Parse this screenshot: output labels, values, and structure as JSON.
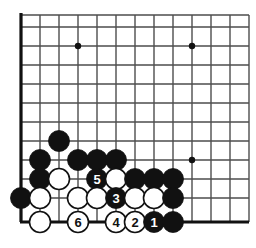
{
  "figure": {
    "kind": "go-board-diagram",
    "title": "",
    "width": 256,
    "height": 248,
    "background_color": "#ffffff",
    "line_color": "#4d4d4d",
    "edge_line_color": "#111111",
    "black_stone_color": "#111111",
    "white_stone_color": "#ffffff",
    "white_stone_border_color": "#111111",
    "black_label_color": "#ffffff",
    "white_label_color": "#111111"
  },
  "grid": {
    "x_lines": [
      21,
      40,
      59,
      78,
      97,
      116,
      135,
      154,
      173,
      192,
      211,
      230,
      249
    ],
    "y_lines": [
      15,
      27,
      46,
      65,
      84,
      103,
      122,
      141,
      160,
      179,
      198,
      222
    ],
    "left_edge_x": 21,
    "bottom_edge_y": 222,
    "spacing": 19,
    "stone_radius": 10.5
  },
  "star_points": [
    {
      "name": "star-point-upper-left",
      "cx": 78,
      "cy": 46,
      "r": 3.2
    },
    {
      "name": "star-point-upper-right",
      "cx": 192,
      "cy": 46,
      "r": 3.2
    },
    {
      "name": "star-point-lower-right",
      "cx": 192,
      "cy": 160,
      "r": 3.2
    }
  ],
  "stones": [
    {
      "name": "black-stone-a",
      "color": "black",
      "cx": 59,
      "cy": 141,
      "label": ""
    },
    {
      "name": "black-stone-b",
      "color": "black",
      "cx": 40,
      "cy": 160,
      "label": ""
    },
    {
      "name": "black-stone-c",
      "color": "black",
      "cx": 78,
      "cy": 160,
      "label": ""
    },
    {
      "name": "black-stone-d",
      "color": "black",
      "cx": 97,
      "cy": 160,
      "label": ""
    },
    {
      "name": "black-stone-e",
      "color": "black",
      "cx": 116,
      "cy": 160,
      "label": ""
    },
    {
      "name": "black-stone-f",
      "color": "black",
      "cx": 40,
      "cy": 179,
      "label": ""
    },
    {
      "name": "white-stone-g",
      "color": "white",
      "cx": 59,
      "cy": 179,
      "label": ""
    },
    {
      "name": "black-stone-move-5",
      "color": "black",
      "cx": 97,
      "cy": 179,
      "label": "5"
    },
    {
      "name": "white-stone-h",
      "color": "white",
      "cx": 116,
      "cy": 179,
      "label": ""
    },
    {
      "name": "black-stone-i",
      "color": "black",
      "cx": 135,
      "cy": 179,
      "label": ""
    },
    {
      "name": "black-stone-j",
      "color": "black",
      "cx": 154,
      "cy": 179,
      "label": ""
    },
    {
      "name": "black-stone-k",
      "color": "black",
      "cx": 173,
      "cy": 179,
      "label": ""
    },
    {
      "name": "black-stone-l",
      "color": "black",
      "cx": 21,
      "cy": 198,
      "label": ""
    },
    {
      "name": "white-stone-m",
      "color": "white",
      "cx": 40,
      "cy": 198,
      "label": ""
    },
    {
      "name": "white-stone-n",
      "color": "white",
      "cx": 78,
      "cy": 198,
      "label": ""
    },
    {
      "name": "white-stone-o",
      "color": "white",
      "cx": 97,
      "cy": 198,
      "label": ""
    },
    {
      "name": "black-stone-move-3",
      "color": "black",
      "cx": 116,
      "cy": 198,
      "label": "3"
    },
    {
      "name": "white-stone-p",
      "color": "white",
      "cx": 135,
      "cy": 198,
      "label": ""
    },
    {
      "name": "white-stone-q",
      "color": "white",
      "cx": 154,
      "cy": 198,
      "label": ""
    },
    {
      "name": "black-stone-r",
      "color": "black",
      "cx": 173,
      "cy": 198,
      "label": ""
    },
    {
      "name": "white-stone-s",
      "color": "white",
      "cx": 40,
      "cy": 222,
      "label": ""
    },
    {
      "name": "white-stone-move-6",
      "color": "white",
      "cx": 78,
      "cy": 222,
      "label": "6"
    },
    {
      "name": "white-stone-move-4",
      "color": "white",
      "cx": 116,
      "cy": 222,
      "label": "4"
    },
    {
      "name": "white-stone-move-2",
      "color": "white",
      "cx": 135,
      "cy": 222,
      "label": "2"
    },
    {
      "name": "black-stone-move-1",
      "color": "black",
      "cx": 154,
      "cy": 222,
      "label": "1"
    },
    {
      "name": "black-stone-t",
      "color": "black",
      "cx": 173,
      "cy": 222,
      "label": ""
    }
  ],
  "move_sequence": [
    {
      "number": "1",
      "color": "black"
    },
    {
      "number": "2",
      "color": "white"
    },
    {
      "number": "3",
      "color": "black"
    },
    {
      "number": "4",
      "color": "white"
    },
    {
      "number": "5",
      "color": "black"
    },
    {
      "number": "6",
      "color": "white"
    }
  ]
}
